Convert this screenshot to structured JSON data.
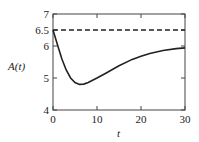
{
  "chart_data": {
    "type": "line",
    "title": "",
    "xlabel": "t",
    "ylabel": "A(t)",
    "xlim": [
      0,
      30
    ],
    "ylim": [
      4,
      7
    ],
    "xticks": [
      "0",
      "10",
      "20",
      "30"
    ],
    "yticks": [
      "4",
      "5",
      "6",
      "6.5",
      "7"
    ],
    "grid": false,
    "series": [
      {
        "name": "A(t)",
        "style": "solid",
        "x": [
          0,
          1,
          2,
          3,
          4,
          5,
          6,
          7,
          8,
          10,
          12,
          15,
          18,
          20,
          22,
          25,
          28,
          30
        ],
        "values": [
          6.5,
          6.05,
          5.6,
          5.25,
          5.0,
          4.86,
          4.8,
          4.81,
          4.86,
          5.0,
          5.15,
          5.38,
          5.58,
          5.68,
          5.77,
          5.86,
          5.92,
          5.94
        ]
      },
      {
        "name": "asymptote",
        "style": "dashed",
        "x": [
          0,
          30
        ],
        "values": [
          6.5,
          6.5
        ]
      }
    ]
  }
}
